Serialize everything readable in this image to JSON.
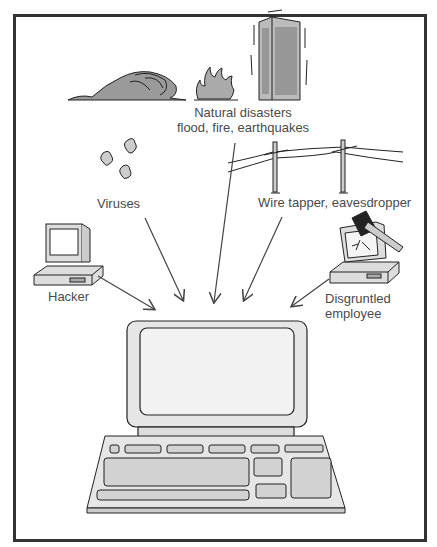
{
  "diagram": {
    "center": "Computer system",
    "threats": {
      "natural": {
        "line1": "Natural disasters",
        "line2": "flood, fire, earthquakes"
      },
      "viruses": "Viruses",
      "wiretap": "Wire tapper, eavesdropper",
      "hacker": "Hacker",
      "disgruntled": {
        "line1": "Disgruntled",
        "line2": "employee"
      }
    }
  }
}
